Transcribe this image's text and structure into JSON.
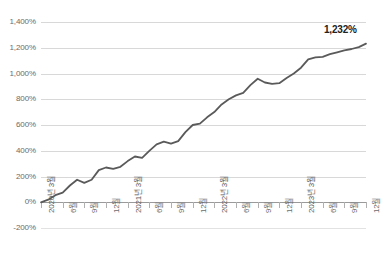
{
  "chart_data": {
    "type": "line",
    "title": "",
    "subtitle": "",
    "xlabel": "",
    "ylabel": "",
    "grid": true,
    "legend": false,
    "ylim": [
      -200,
      1400
    ],
    "ytick_labels": [
      "1,400%",
      "1,200%",
      "1,000%",
      "800%",
      "600%",
      "400%",
      "200%",
      "0%",
      "-200%"
    ],
    "ytick_values": [
      1400,
      1200,
      1000,
      800,
      600,
      400,
      200,
      0,
      -200
    ],
    "xtick_labels": [
      "2020년 3월",
      "6월",
      "9월",
      "12월",
      "2021년 3월",
      "6월",
      "9월",
      "12월",
      "2022년 3월",
      "6월",
      "9월",
      "12월",
      "2023년 3월",
      "6월",
      "9월",
      "12월"
    ],
    "xtick_major": [
      true,
      false,
      false,
      false,
      true,
      false,
      false,
      false,
      true,
      false,
      false,
      false,
      true,
      false,
      false,
      false
    ],
    "x": [
      "2020-03",
      "2020-04",
      "2020-05",
      "2020-06",
      "2020-07",
      "2020-08",
      "2020-09",
      "2020-10",
      "2020-11",
      "2020-12",
      "2021-01",
      "2021-02",
      "2021-03",
      "2021-04",
      "2021-05",
      "2021-06",
      "2021-07",
      "2021-08",
      "2021-09",
      "2021-10",
      "2021-11",
      "2021-12",
      "2022-01",
      "2022-02",
      "2022-03",
      "2022-04",
      "2022-05",
      "2022-06",
      "2022-07",
      "2022-08",
      "2022-09",
      "2022-10",
      "2022-11",
      "2022-12",
      "2023-01",
      "2023-02",
      "2023-03",
      "2023-04",
      "2023-05",
      "2023-06",
      "2023-07",
      "2023-08",
      "2023-09",
      "2023-10",
      "2023-11",
      "2023-12"
    ],
    "values": [
      0,
      20,
      55,
      75,
      130,
      175,
      150,
      175,
      250,
      270,
      260,
      275,
      320,
      355,
      345,
      400,
      450,
      470,
      455,
      475,
      545,
      600,
      610,
      660,
      700,
      760,
      800,
      830,
      850,
      910,
      960,
      930,
      920,
      925,
      965,
      1000,
      1045,
      1110,
      1125,
      1130,
      1150,
      1165,
      1180,
      1190,
      1205,
      1232
    ],
    "series_color": "#5a5a5a",
    "grid_color": "#d8d8d8",
    "axis_color": "#9a9a9a",
    "end_label": "1,232%",
    "end_label_value": 1232
  }
}
